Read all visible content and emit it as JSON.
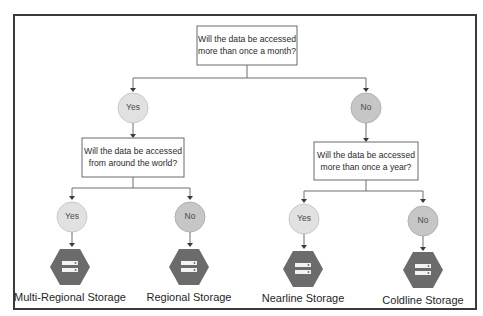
{
  "diagram": {
    "root_question": {
      "line1": "Will the data be accessed",
      "line2": "more than once a month?"
    },
    "branches": [
      {
        "answer": "Yes",
        "question": {
          "line1": "Will the data be accessed",
          "line2": "from around the world?"
        },
        "leaves": [
          {
            "answer": "Yes",
            "icon": "storage-hexagon-icon",
            "label": "Multi-Regional Storage"
          },
          {
            "answer": "No",
            "icon": "storage-hexagon-icon",
            "label": "Regional Storage"
          }
        ]
      },
      {
        "answer": "No",
        "question": {
          "line1": "Will the data be accessed",
          "line2": "more than once a year?"
        },
        "leaves": [
          {
            "answer": "Yes",
            "icon": "storage-hexagon-icon",
            "label": "Nearline Storage"
          },
          {
            "answer": "No",
            "icon": "storage-hexagon-icon",
            "label": "Coldline Storage"
          }
        ]
      }
    ],
    "colors": {
      "yes_node": "#e1e1e1",
      "no_node": "#c6c6c6",
      "storage_icon": "#6b6b6b",
      "frame": "#3a3a3a"
    }
  }
}
